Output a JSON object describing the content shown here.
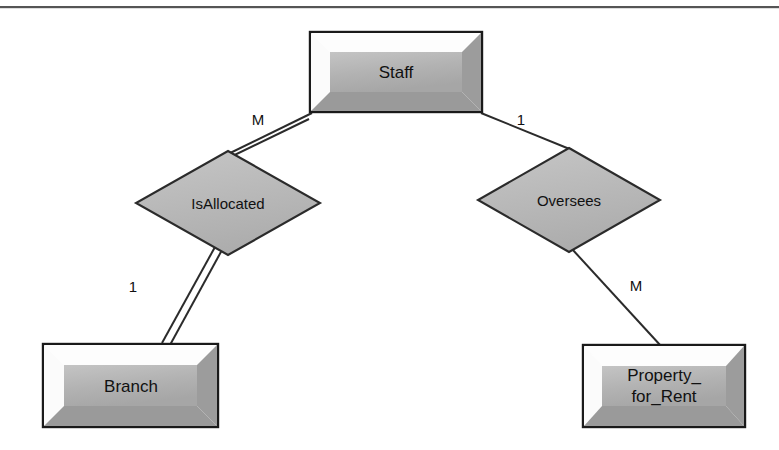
{
  "diagram": {
    "type": "entity-relationship-diagram",
    "title": "",
    "background_color": "#ffffff",
    "top_rule_color": "#555555",
    "entity_fill": "#b3b3b3",
    "entity_bevel_light": "#ffffff",
    "entity_bevel_dark": "#8f8f8f",
    "entity_border_color": "#1a1a1a",
    "relationship_fill": "#b9b9b9",
    "relationship_border_color": "#2b2b2b",
    "line_color": "#2b2b2b",
    "entities": [
      {
        "id": "staff",
        "name": "Staff",
        "lines": [
          "Staff"
        ],
        "x": 310,
        "y": 32,
        "width": 172,
        "height": 80
      },
      {
        "id": "branch",
        "name": "Branch",
        "lines": [
          "Branch"
        ],
        "x": 43,
        "y": 344,
        "width": 175,
        "height": 83
      },
      {
        "id": "property_for_rent",
        "name": "Property_for_Rent",
        "lines": [
          "Property_",
          "for_Rent"
        ],
        "x": 583,
        "y": 345,
        "width": 162,
        "height": 82
      }
    ],
    "relationships": [
      {
        "id": "isallocated",
        "name": "IsAllocated",
        "cx": 228,
        "cy": 203,
        "rx": 92,
        "ry": 52,
        "participation": "total",
        "line_style": "double"
      },
      {
        "id": "oversees",
        "name": "Oversees",
        "cx": 569,
        "cy": 200,
        "rx": 91,
        "ry": 52,
        "participation": "partial",
        "line_style": "single"
      }
    ],
    "connectors": [
      {
        "id": "staff-isallocated",
        "from": "staff",
        "to": "isallocated",
        "style": "double",
        "cardinality": "M",
        "label_x": 258,
        "label_y": 125
      },
      {
        "id": "isallocated-branch",
        "from": "isallocated",
        "to": "branch",
        "style": "double",
        "cardinality": "1",
        "label_x": 133,
        "label_y": 292
      },
      {
        "id": "staff-oversees",
        "from": "staff",
        "to": "oversees",
        "style": "single",
        "cardinality": "1",
        "label_x": 521,
        "label_y": 125
      },
      {
        "id": "oversees-property",
        "from": "oversees",
        "to": "property_for_rent",
        "style": "single",
        "cardinality": "M",
        "label_x": 636,
        "label_y": 291
      }
    ]
  }
}
